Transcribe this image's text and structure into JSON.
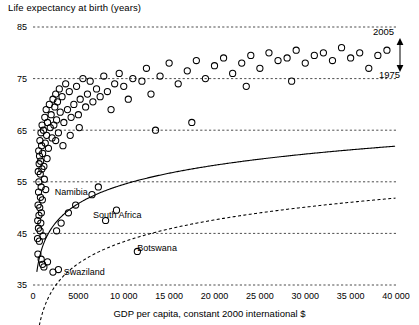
{
  "chart_data": {
    "type": "scatter",
    "title": "Life expectancy at birth (years)",
    "xlabel": "GDP per capita, constant 2000 international $",
    "ylabel": "Life expectancy at birth (years)",
    "xlim": [
      0,
      40000
    ],
    "ylim": [
      35,
      85
    ],
    "grid": true,
    "xticks": [
      0,
      5000,
      10000,
      15000,
      20000,
      25000,
      30000,
      35000,
      40000
    ],
    "xticklabels": [
      "0",
      "5000",
      "10 000",
      "15 000",
      "20 000",
      "25 000",
      "30 000",
      "35 000",
      "40 000"
    ],
    "yticks": [
      35,
      45,
      55,
      65,
      75,
      85
    ],
    "yticklabels": [
      "35",
      "45",
      "55",
      "65",
      "75",
      "85"
    ],
    "marker": "open-circle",
    "series": [
      {
        "name": "2005 countries",
        "points": [
          [
            500,
            44.0
          ],
          [
            520,
            47.5
          ],
          [
            540,
            41.0
          ],
          [
            560,
            50.5
          ],
          [
            580,
            57.0
          ],
          [
            600,
            46.0
          ],
          [
            610,
            53.0
          ],
          [
            630,
            61.0
          ],
          [
            650,
            55.0
          ],
          [
            660,
            48.5
          ],
          [
            680,
            58.5
          ],
          [
            700,
            43.5
          ],
          [
            720,
            60.0
          ],
          [
            740,
            50.0
          ],
          [
            760,
            63.0
          ],
          [
            780,
            45.5
          ],
          [
            800,
            56.5
          ],
          [
            820,
            52.0
          ],
          [
            840,
            59.0
          ],
          [
            860,
            47.0
          ],
          [
            880,
            64.5
          ],
          [
            900,
            54.0
          ],
          [
            920,
            49.0
          ],
          [
            950,
            62.0
          ],
          [
            980,
            57.5
          ],
          [
            1000,
            66.0
          ],
          [
            1030,
            51.5
          ],
          [
            1060,
            60.5
          ],
          [
            1100,
            44.5
          ],
          [
            1150,
            65.0
          ],
          [
            1200,
            58.0
          ],
          [
            1250,
            55.5
          ],
          [
            1300,
            67.5
          ],
          [
            1350,
            62.5
          ],
          [
            1400,
            53.5
          ],
          [
            1450,
            69.0
          ],
          [
            1500,
            64.0
          ],
          [
            1550,
            59.5
          ],
          [
            1600,
            66.5
          ],
          [
            1700,
            61.5
          ],
          [
            1800,
            70.0
          ],
          [
            1900,
            65.5
          ],
          [
            2000,
            68.0
          ],
          [
            2100,
            63.5
          ],
          [
            2200,
            71.0
          ],
          [
            2300,
            66.0
          ],
          [
            2400,
            69.5
          ],
          [
            2500,
            72.0
          ],
          [
            2600,
            67.0
          ],
          [
            2700,
            70.5
          ],
          [
            2800,
            64.5
          ],
          [
            2900,
            73.0
          ],
          [
            3000,
            68.5
          ],
          [
            3200,
            71.5
          ],
          [
            3400,
            66.5
          ],
          [
            3600,
            74.0
          ],
          [
            3800,
            69.0
          ],
          [
            4000,
            72.5
          ],
          [
            4200,
            67.5
          ],
          [
            4500,
            70.0
          ],
          [
            4800,
            73.5
          ],
          [
            5000,
            68.0
          ],
          [
            5200,
            71.0
          ],
          [
            5500,
            75.0
          ],
          [
            5800,
            69.5
          ],
          [
            6000,
            72.0
          ],
          [
            6300,
            74.5
          ],
          [
            6600,
            70.5
          ],
          [
            7000,
            73.0
          ],
          [
            7400,
            71.5
          ],
          [
            7800,
            75.5
          ],
          [
            8200,
            72.5
          ],
          [
            8600,
            69.0
          ],
          [
            9000,
            74.0
          ],
          [
            9500,
            76.0
          ],
          [
            10000,
            73.5
          ],
          [
            10500,
            71.0
          ],
          [
            11000,
            75.0
          ],
          [
            11500,
            41.5
          ],
          [
            12000,
            74.5
          ],
          [
            12500,
            77.0
          ],
          [
            13000,
            72.0
          ],
          [
            14000,
            75.5
          ],
          [
            15000,
            78.0
          ],
          [
            16000,
            74.0
          ],
          [
            17000,
            76.5
          ],
          [
            18000,
            78.5
          ],
          [
            19000,
            75.0
          ],
          [
            20000,
            77.5
          ],
          [
            21000,
            79.0
          ],
          [
            22000,
            76.0
          ],
          [
            23000,
            78.0
          ],
          [
            24000,
            79.5
          ],
          [
            25000,
            77.0
          ],
          [
            26000,
            80.0
          ],
          [
            27000,
            78.5
          ],
          [
            28000,
            79.0
          ],
          [
            29000,
            80.5
          ],
          [
            30000,
            78.0
          ],
          [
            31000,
            79.5
          ],
          [
            32000,
            80.0
          ],
          [
            33000,
            78.5
          ],
          [
            34000,
            81.0
          ],
          [
            35000,
            79.0
          ],
          [
            36000,
            80.0
          ],
          [
            37000,
            77.0
          ],
          [
            38000,
            79.5
          ],
          [
            39000,
            80.5
          ],
          [
            2600,
            45.5
          ],
          [
            3100,
            47.0
          ],
          [
            3900,
            49.0
          ],
          [
            4700,
            50.5
          ],
          [
            1200,
            38.5
          ],
          [
            1600,
            39.5
          ],
          [
            2200,
            37.5
          ],
          [
            2800,
            38.0
          ],
          [
            900,
            40.0
          ],
          [
            1050,
            39.0
          ],
          [
            6500,
            52.5
          ],
          [
            7200,
            54.0
          ],
          [
            8000,
            47.5
          ],
          [
            9200,
            49.5
          ],
          [
            2500,
            63.0
          ],
          [
            3300,
            62.0
          ],
          [
            4100,
            64.0
          ],
          [
            5100,
            65.5
          ],
          [
            13500,
            65.0
          ],
          [
            17500,
            66.5
          ],
          [
            23500,
            73.5
          ],
          [
            28500,
            74.5
          ]
        ]
      }
    ],
    "curves": [
      {
        "name": "2005",
        "style": "solid",
        "label": "2005"
      },
      {
        "name": "1975",
        "style": "dashed",
        "label": "1975"
      }
    ],
    "annotations": [
      {
        "label": "Namibia",
        "x": 2400,
        "y": 52.5
      },
      {
        "label": "South Africa",
        "x": 6600,
        "y": 48.0
      },
      {
        "label": "Botswana",
        "x": 11500,
        "y": 41.5
      },
      {
        "label": "Swaziland",
        "x": 3400,
        "y": 37.0
      }
    ],
    "curve_gap_arrow": {
      "present": true,
      "description": "double-headed vertical arrow between 1975 and 2005 curves at right edge"
    }
  },
  "colors": {
    "axis": "#000000",
    "grid": "#000000",
    "marker_stroke": "#000000",
    "background": "#ffffff"
  }
}
